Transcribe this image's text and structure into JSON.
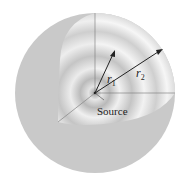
{
  "diagram": {
    "labels": {
      "r1": "r",
      "r1_sub": "1",
      "r2": "r",
      "r2_sub": "2",
      "source": "Source"
    },
    "colors": {
      "sphere": "#c8c8c8",
      "shell_light": "#f4f4f4",
      "shell_dark": "#bdbdbd",
      "lines": "#555555",
      "arrows": "#333333"
    }
  }
}
